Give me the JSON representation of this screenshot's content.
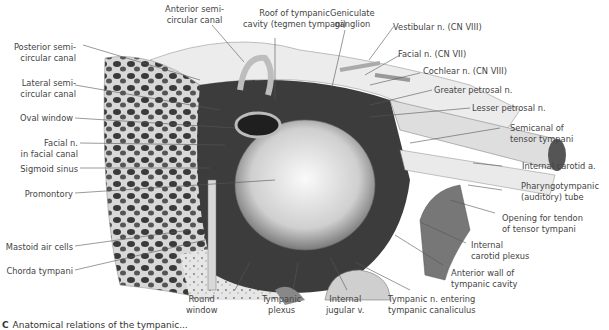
{
  "figure": {
    "caption_marker": "C",
    "caption": "Anatomical relations of the tympanic..."
  },
  "labels": {
    "anterior_semicircular_canal": [
      "Anterior semi-",
      "circular canal"
    ],
    "roof_tympanic_cavity": [
      "Roof of tympanic",
      "cavity (tegmen tympani)"
    ],
    "geniculate_ganglion": [
      "Geniculate",
      "ganglion"
    ],
    "vestibular_n": "Vestibular n. (CN VIII)",
    "facial_n": "Facial n. (CN VII)",
    "cochlear_n": "Cochlear n. (CN VIII)",
    "greater_petrosal_n": "Greater petrosal n.",
    "lesser_petrosal_n": "Lesser petrosal n.",
    "semicanal_tensor_tympani": [
      "Semicanal of",
      "tensor tympani"
    ],
    "internal_carotid_a": "Internal carotid a.",
    "pharyngotympanic_tube": [
      "Pharyngotympanic",
      "(auditory) tube"
    ],
    "opening_tendon_tensor": [
      "Opening for tendon",
      "of tensor tympani"
    ],
    "internal_carotid_plexus": [
      "Internal",
      "carotid plexus"
    ],
    "anterior_wall": [
      "Anterior wall of",
      "tympanic cavity"
    ],
    "tympanic_n_entering": [
      "Tympanic n. entering",
      "tympanic canaliculus"
    ],
    "internal_jugular_v": [
      "Internal",
      "jugular v."
    ],
    "tympanic_plexus": [
      "Tympanic",
      "plexus"
    ],
    "round_window": [
      "Round",
      "window"
    ],
    "posterior_semicircular_canal": [
      "Posterior semi-",
      "circular canal"
    ],
    "lateral_semicircular_canal": [
      "Lateral semi-",
      "circular canal"
    ],
    "oval_window": "Oval window",
    "facial_n_canal": [
      "Facial n.",
      "in facial canal"
    ],
    "sigmoid_sinus": "Sigmoid sinus",
    "promontory": "Promontory",
    "mastoid_air_cells": "Mastoid air cells",
    "chorda_tympani": "Chorda tympani"
  }
}
